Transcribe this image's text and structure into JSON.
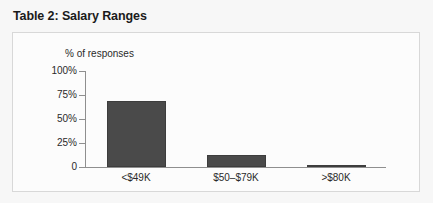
{
  "chart_title": "Table 2: Salary Ranges",
  "chart_data": {
    "type": "bar",
    "title": "Table 2: Salary Ranges",
    "xlabel": "",
    "ylabel": "% of responses",
    "categories": [
      "<$49K",
      "$50–$79K",
      ">$80K"
    ],
    "values": [
      69,
      13,
      1
    ],
    "ylim": [
      0,
      100
    ],
    "yticks": [
      0,
      25,
      50,
      75,
      100
    ],
    "ytick_labels": [
      "0",
      "25%",
      "50%",
      "75%",
      "100%"
    ],
    "grid": false,
    "legend": false,
    "bar_color": "#4a4a4a",
    "axis_color": "#8f8f8f",
    "panel_border_color": "#d8d8d8",
    "background_color": "#f7f7f7"
  }
}
